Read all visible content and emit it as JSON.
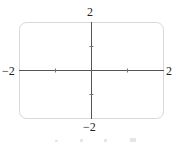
{
  "diagram": {
    "type": "coordinate-axes",
    "x_range": [
      -2,
      2
    ],
    "y_range": [
      -2,
      2
    ],
    "labels": {
      "x_min": "−2",
      "x_max": "2",
      "y_min": "−2",
      "y_max": "2"
    },
    "ticks": {
      "x": [
        -1,
        1
      ],
      "y": [
        -1,
        1
      ]
    },
    "frame": "rounded-rectangle",
    "colors": {
      "axis": "#555555",
      "frame": "#d8d8d8"
    }
  }
}
